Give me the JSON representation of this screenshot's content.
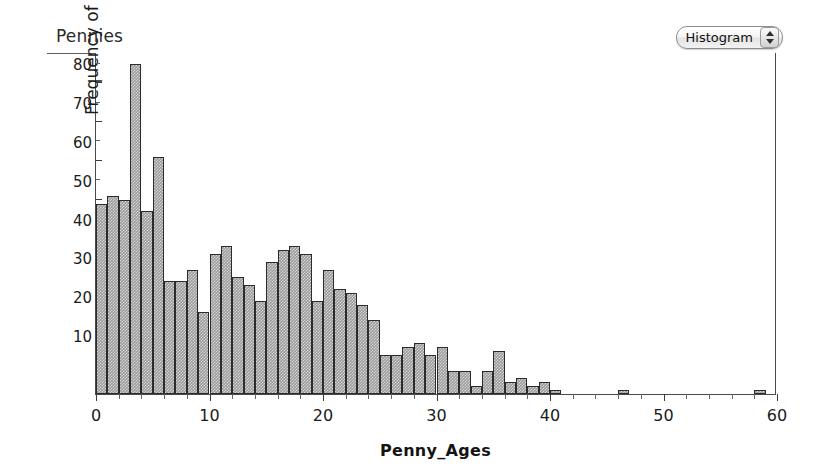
{
  "panel": {
    "title": "Pennies"
  },
  "chart_type_popup": {
    "selected": "Histogram",
    "stepper_up_icon": "triangle-up-icon",
    "stepper_down_icon": "triangle-down-icon"
  },
  "chart_data": {
    "type": "bar",
    "title": "Pennies",
    "xlabel": "Penny_Ages",
    "ylabel": "Frequency of Penny_Ages",
    "ylabel_plain_prefix": "Frequency of ",
    "ylabel_bold_part": "Penny_Ages",
    "xlim": [
      0,
      60
    ],
    "ylim": [
      0,
      88
    ],
    "grid": false,
    "legend": null,
    "bin_width": 1,
    "x_major_ticks": [
      0,
      10,
      20,
      30,
      40,
      50,
      60
    ],
    "x_minor_step": 2,
    "y_major_ticks": [
      10,
      20,
      30,
      40,
      50,
      60,
      70,
      80
    ],
    "y_minor_step": 5,
    "bar_fill_color": "#9a9a9a",
    "bar_edge_color": "#2b2b2b",
    "categories": [
      0,
      1,
      2,
      3,
      4,
      5,
      6,
      7,
      8,
      9,
      10,
      11,
      12,
      13,
      14,
      15,
      16,
      17,
      18,
      19,
      20,
      21,
      22,
      23,
      24,
      25,
      26,
      27,
      28,
      29,
      30,
      31,
      32,
      33,
      34,
      35,
      36,
      37,
      38,
      39,
      40,
      46,
      58
    ],
    "values": [
      49,
      51,
      50,
      85,
      47,
      61,
      29,
      29,
      32,
      21,
      36,
      38,
      30,
      28,
      24,
      34,
      37,
      38,
      36,
      24,
      32,
      27,
      26,
      23,
      19,
      10,
      10,
      12,
      13,
      10,
      12,
      6,
      6,
      2,
      6,
      11,
      3,
      4,
      2,
      3,
      1,
      1,
      1
    ]
  }
}
